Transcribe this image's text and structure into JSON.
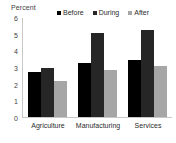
{
  "chart_data": {
    "type": "bar",
    "title": "",
    "xlabel": "",
    "ylabel": "Percent",
    "ylim": [
      0,
      6
    ],
    "yticks": [
      6,
      5,
      4,
      3,
      2,
      1,
      0
    ],
    "grid": false,
    "legend_position": "top",
    "categories": [
      "Agriculture",
      "Manufacturing",
      "Services"
    ],
    "series": [
      {
        "name": "Before",
        "color": "#000000",
        "values": [
          2.7,
          3.25,
          3.45
        ]
      },
      {
        "name": "During",
        "color": "#262626",
        "values": [
          2.95,
          5.1,
          5.3
        ]
      },
      {
        "name": "After",
        "color": "#a6a6a6",
        "values": [
          2.2,
          2.85,
          3.1
        ]
      }
    ]
  },
  "axis": {
    "y_title": "Percent",
    "y_tick_labels": [
      "6",
      "5",
      "4",
      "3",
      "2",
      "1",
      "0"
    ]
  },
  "legend": {
    "items": [
      {
        "label": "Before",
        "color": "#000000"
      },
      {
        "label": "During",
        "color": "#262626"
      },
      {
        "label": "After",
        "color": "#a6a6a6"
      }
    ]
  },
  "colors": {
    "axis_line": "#c8c8c8",
    "text": "#2b2b2b",
    "tick_text": "#3f3f3f",
    "background": "#ffffff"
  }
}
